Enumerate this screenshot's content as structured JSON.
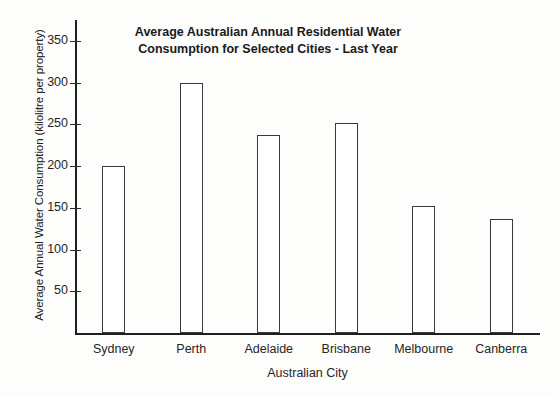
{
  "chart_data": {
    "type": "bar",
    "title": "Average Australian Annual Residential Water Consumption for Selected Cities - Last Year",
    "title_line1": "Average Australian Annual Residential Water",
    "title_line2": "Consumption for Selected Cities - Last Year",
    "xlabel": "Australian City",
    "ylabel": "Average Annual Water Consumption (kilolitre per property)",
    "categories": [
      "Sydney",
      "Perth",
      "Adelaide",
      "Brisbane",
      "Melbourne",
      "Canberra"
    ],
    "values": [
      200,
      300,
      237,
      252,
      152,
      137
    ],
    "ylim": [
      0,
      375
    ],
    "yticks": [
      50,
      100,
      150,
      200,
      250,
      300,
      350
    ],
    "ytick_labels": [
      "50",
      "100",
      "150",
      "200",
      "250",
      "300",
      "350"
    ],
    "grid": false,
    "legend": "none",
    "bar_fill": "#ffffff",
    "bar_edge": "#3a3a3a",
    "axis_color": "#1f1f1f",
    "background": "#fdfdfc"
  }
}
